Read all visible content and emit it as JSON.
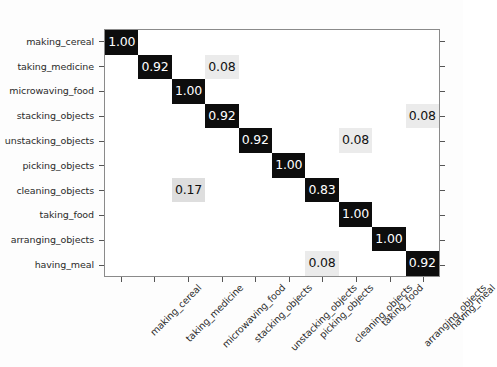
{
  "figure": {
    "title": "",
    "axis_left_label": "",
    "axis_bottom_label": ""
  },
  "chart_data": {
    "type": "heatmap",
    "title": "",
    "xlabel": "",
    "ylabel": "",
    "grid": false,
    "legend": "none",
    "value_format": "0.00",
    "colormap": "grayscale-inverted",
    "vmin": 0,
    "vmax": 1,
    "categories": [
      "making_cereal",
      "taking_medicine",
      "microwaving_food",
      "stacking_objects",
      "unstacking_objects",
      "picking_objects",
      "cleaning_objects",
      "taking_food",
      "arranging_objects",
      "having_meal"
    ],
    "x_tick_labels": [
      "making_cereal",
      "taking_medicine",
      "microwaving_food",
      "stacking_objects",
      "unstacking_objects",
      "picking_objects",
      "cleaning_objects",
      "taking_food",
      "arranging_objects",
      "having_meal"
    ],
    "y_tick_labels": [
      "making_cereal",
      "taking_medicine",
      "microwaving_food",
      "stacking_objects",
      "unstacking_objects",
      "picking_objects",
      "cleaning_objects",
      "taking_food",
      "arranging_objects",
      "having_meal"
    ],
    "matrix": [
      [
        1.0,
        0,
        0,
        0,
        0,
        0,
        0,
        0,
        0,
        0
      ],
      [
        0,
        0.92,
        0,
        0.08,
        0,
        0,
        0,
        0,
        0,
        0
      ],
      [
        0,
        0,
        1.0,
        0,
        0,
        0,
        0,
        0,
        0,
        0
      ],
      [
        0,
        0,
        0,
        0.92,
        0,
        0,
        0,
        0,
        0,
        0.08
      ],
      [
        0,
        0,
        0,
        0,
        0.92,
        0,
        0,
        0.08,
        0,
        0
      ],
      [
        0,
        0,
        0,
        0,
        0,
        1.0,
        0,
        0,
        0,
        0
      ],
      [
        0,
        0,
        0.17,
        0,
        0,
        0,
        0.83,
        0,
        0,
        0
      ],
      [
        0,
        0,
        0,
        0,
        0,
        0,
        0,
        1.0,
        0,
        0
      ],
      [
        0,
        0,
        0,
        0,
        0,
        0,
        0,
        0,
        1.0,
        0
      ],
      [
        0,
        0,
        0,
        0,
        0,
        0,
        0.08,
        0,
        0,
        0.92
      ]
    ],
    "cell_labels": [
      [
        "1.00",
        "",
        "",
        "",
        "",
        "",
        "",
        "",
        "",
        ""
      ],
      [
        "",
        "0.92",
        "",
        "0.08",
        "",
        "",
        "",
        "",
        "",
        ""
      ],
      [
        "",
        "",
        "1.00",
        "",
        "",
        "",
        "",
        "",
        "",
        ""
      ],
      [
        "",
        "",
        "",
        "0.92",
        "",
        "",
        "",
        "",
        "",
        "0.08"
      ],
      [
        "",
        "",
        "",
        "",
        "0.92",
        "",
        "",
        "0.08",
        "",
        ""
      ],
      [
        "",
        "",
        "",
        "",
        "",
        "1.00",
        "",
        "",
        "",
        ""
      ],
      [
        "",
        "",
        "0.17",
        "",
        "",
        "",
        "0.83",
        "",
        "",
        ""
      ],
      [
        "",
        "",
        "",
        "",
        "",
        "",
        "",
        "1.00",
        "",
        ""
      ],
      [
        "",
        "",
        "",
        "",
        "",
        "",
        "",
        "",
        "1.00",
        ""
      ],
      [
        "",
        "",
        "",
        "",
        "",
        "",
        "0.08",
        "",
        "",
        "0.92"
      ]
    ]
  },
  "colors": {
    "high_cell_bg": "#0d0d0d",
    "high_cell_text": "#ffffff",
    "mid_cell_bg": "#dedede",
    "low_cell_bg": "#ebebeb",
    "cell_text": "#111111",
    "axis_line": "#8a8a8a",
    "tick_label": "#2b2b2b",
    "figure_bg": "#fdfdfd"
  }
}
